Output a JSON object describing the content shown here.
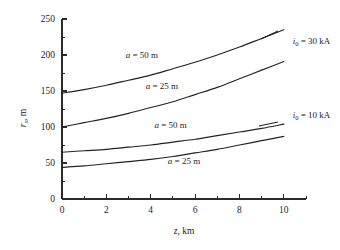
{
  "chart_data": {
    "type": "line",
    "title": "",
    "xlabel": "z, km",
    "ylabel": "r_s, m",
    "xlim": [
      0,
      11
    ],
    "ylim": [
      0,
      250
    ],
    "grid": false,
    "legend_position": "inline-annotations",
    "x_ticks": [
      "0",
      "2",
      "4",
      "6",
      "8",
      "10"
    ],
    "x_tick_values": [
      0,
      2,
      4,
      6,
      8,
      10
    ],
    "x_minor_step": 1,
    "y_ticks": [
      "0",
      "50",
      "100",
      "150",
      "200",
      "250"
    ],
    "y_tick_values": [
      0,
      50,
      100,
      150,
      200,
      250
    ],
    "y_minor_step": 25,
    "x": [
      0,
      1,
      2,
      3,
      4,
      5,
      6,
      7,
      8,
      9,
      10
    ],
    "series": [
      {
        "name": "i0 = 30 kA, a = 50 m",
        "current_kA": 30,
        "a_m": 50,
        "values": [
          147,
          152,
          158,
          165,
          172,
          181,
          190,
          200,
          211,
          223,
          235
        ]
      },
      {
        "name": "i0 = 30 kA, a = 25 m",
        "current_kA": 30,
        "a_m": 25,
        "values": [
          100,
          106,
          112,
          119,
          127,
          135,
          145,
          155,
          167,
          179,
          191
        ]
      },
      {
        "name": "i0 = 10 kA, a = 50 m",
        "current_kA": 10,
        "a_m": 50,
        "values": [
          65,
          67,
          69,
          72,
          75,
          79,
          83,
          88,
          93,
          98,
          104
        ]
      },
      {
        "name": "i0 = 10 kA, a = 25 m",
        "current_kA": 10,
        "a_m": 25,
        "values": [
          44,
          46,
          49,
          52,
          55,
          59,
          64,
          69,
          75,
          81,
          87
        ]
      }
    ],
    "annotations": [
      {
        "id": "curve-label-a50-top",
        "text_prefix": "a",
        "text_rest": " = 50 m",
        "x": 3.6,
        "y": 196
      },
      {
        "id": "curve-label-a25-top",
        "text_prefix": "a",
        "text_rest": " = 25 m",
        "x": 4.5,
        "y": 153
      },
      {
        "id": "curve-label-a50-bottom",
        "text_prefix": "a",
        "text_rest": " = 50 m",
        "x": 4.9,
        "y": 99
      },
      {
        "id": "curve-label-a25-bottom",
        "text_prefix": "a",
        "text_rest": " = 25 m",
        "x": 5.5,
        "y": 48
      },
      {
        "id": "current-label-30ka",
        "text_prefix": "i",
        "text_sub": "0",
        "text_rest": " = 30 kA",
        "x": 10.4,
        "y": 215
      },
      {
        "id": "current-label-10ka",
        "text_prefix": "i",
        "text_sub": "0",
        "text_rest": " = 10 kA",
        "x": 10.4,
        "y": 112
      }
    ]
  },
  "axes": {
    "y_title_var": "r",
    "y_title_sub": "s",
    "y_title_rest": ", m",
    "x_title_var": "z",
    "x_title_rest": ", km"
  },
  "colors": {
    "curve": "#232323",
    "axis": "#2b2b2b",
    "text": "#1d1d1d",
    "background": "#ffffff"
  }
}
